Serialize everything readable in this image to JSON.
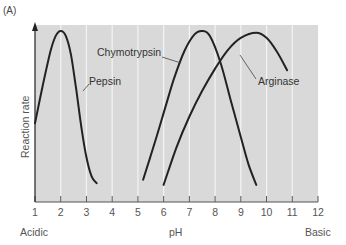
{
  "panel_label": "(A)",
  "chart_data": {
    "type": "line",
    "title": "",
    "xlabel": "pH",
    "ylabel": "Reaction rate",
    "x_ticks": [
      1,
      2,
      3,
      4,
      5,
      6,
      7,
      8,
      9,
      10,
      11,
      12
    ],
    "x_end_labels": {
      "left": "Acidic",
      "right": "Basic"
    },
    "xlim": [
      1,
      12
    ],
    "y_ticks": [],
    "grid": "vertical white lines at each integer pH",
    "background": "#d9d9d9",
    "series": [
      {
        "name": "Pepsin",
        "peak_pH": 2.0,
        "points": [
          [
            1.0,
            0.46
          ],
          [
            1.3,
            0.68
          ],
          [
            1.6,
            0.88
          ],
          [
            1.8,
            0.97
          ],
          [
            2.0,
            1.0
          ],
          [
            2.2,
            0.97
          ],
          [
            2.4,
            0.86
          ],
          [
            2.6,
            0.66
          ],
          [
            2.8,
            0.44
          ],
          [
            3.0,
            0.26
          ],
          [
            3.2,
            0.15
          ],
          [
            3.4,
            0.11
          ]
        ]
      },
      {
        "name": "Chymotrypsin",
        "peak_pH": 7.5,
        "points": [
          [
            5.2,
            0.13
          ],
          [
            5.6,
            0.32
          ],
          [
            6.0,
            0.52
          ],
          [
            6.4,
            0.72
          ],
          [
            6.8,
            0.88
          ],
          [
            7.2,
            0.98
          ],
          [
            7.5,
            1.0
          ],
          [
            7.8,
            0.97
          ],
          [
            8.2,
            0.82
          ],
          [
            8.6,
            0.6
          ],
          [
            9.0,
            0.38
          ],
          [
            9.3,
            0.22
          ],
          [
            9.6,
            0.1
          ]
        ]
      },
      {
        "name": "Arginase",
        "peak_pH": 9.6,
        "points": [
          [
            6.0,
            0.1
          ],
          [
            6.5,
            0.32
          ],
          [
            7.0,
            0.5
          ],
          [
            7.5,
            0.65
          ],
          [
            8.0,
            0.78
          ],
          [
            8.5,
            0.89
          ],
          [
            9.0,
            0.96
          ],
          [
            9.6,
            0.99
          ],
          [
            10.0,
            0.96
          ],
          [
            10.4,
            0.88
          ],
          [
            10.8,
            0.77
          ]
        ]
      }
    ],
    "annotations": [
      {
        "text": "Pepsin",
        "points_to": "Pepsin descending limb near pH 2.7"
      },
      {
        "text": "Chymotrypsin",
        "points_to": "Chymotrypsin ascending limb near pH 6.7"
      },
      {
        "text": "Arginase",
        "points_to": "Arginase ascending limb near pH 8.2"
      }
    ]
  }
}
